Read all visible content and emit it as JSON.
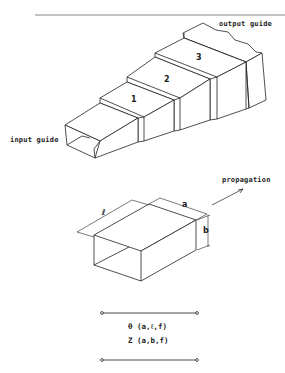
{
  "figure": {
    "top_diagram": {
      "labels": {
        "output_guide": "output guide",
        "input_guide": "input guide"
      },
      "sections": [
        "1",
        "2",
        "3"
      ]
    },
    "middle_diagram": {
      "propagation_label": "propagation",
      "dimensions": {
        "length": "ℓ",
        "width": "a",
        "height": "b"
      }
    },
    "circuit": {
      "line1": "θ (a,ℓ,f)",
      "line2": "Z (a,b,f)"
    }
  },
  "colors": {
    "line": "#222222",
    "background": "#ffffff",
    "rule": "#888888"
  }
}
